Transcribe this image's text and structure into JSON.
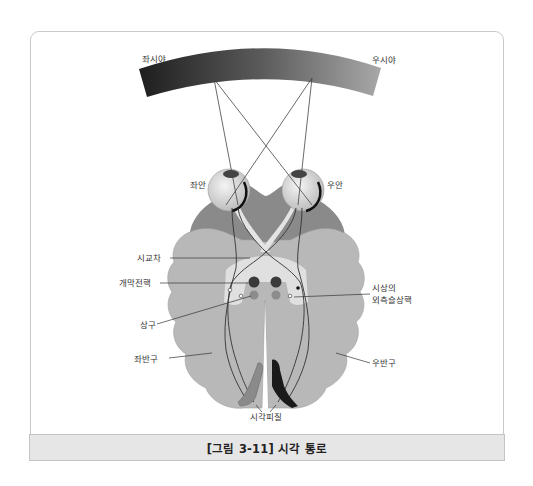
{
  "figure": {
    "caption": "[그림 3-11] 시각 통로",
    "field_labels": {
      "left_visual_field": "좌시야",
      "right_visual_field": "우시야"
    },
    "eye_labels": {
      "left_eye": "좌안",
      "right_eye": "우안"
    },
    "structure_labels": {
      "optic_chiasm": "시교차",
      "pretectal_nucleus": "개막전핵",
      "superior_colliculus": "상구",
      "left_hemisphere": "좌반구",
      "right_hemisphere": "우반구",
      "lgn_line1": "시상의",
      "lgn_line2": "외측슬상핵",
      "visual_cortex": "시각피질"
    },
    "colors": {
      "field_dark": "#2a2a2a",
      "field_light": "#9a9a9a",
      "brain_outer": "#8a8a8a",
      "brain_inner": "#b5b5b5",
      "tract_fill": "#e2e2e2",
      "nucleus_dark": "#3a3a3a",
      "nucleus_light": "#8c8c8c",
      "caption_band": "#e6e6e6"
    }
  }
}
